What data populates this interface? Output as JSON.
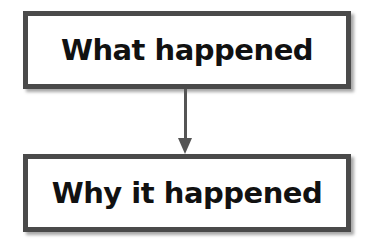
{
  "diagram": {
    "nodes": [
      {
        "id": "what",
        "label": "What happened"
      },
      {
        "id": "why",
        "label": "Why it happened"
      }
    ],
    "edges": [
      {
        "from": "what",
        "to": "why",
        "type": "arrow"
      }
    ]
  }
}
